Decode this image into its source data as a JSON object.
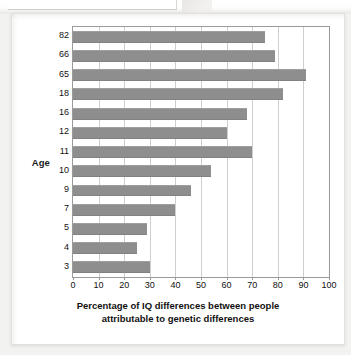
{
  "chart_data": {
    "type": "bar",
    "orientation": "horizontal",
    "title": "",
    "subtitle": "",
    "xlabel": "Percentage of IQ differences between people attributable to genetic differences",
    "xlabel_line1": "Percentage of IQ differences between people",
    "xlabel_line2": "attributable to genetic differences",
    "ylabel": "Age",
    "categories": [
      "82",
      "66",
      "65",
      "18",
      "16",
      "12",
      "11",
      "10",
      "9",
      "7",
      "5",
      "4",
      "3"
    ],
    "values": [
      75,
      79,
      91,
      82,
      68,
      60,
      70,
      54,
      46,
      40,
      29,
      25,
      30
    ],
    "xlim": [
      0,
      100
    ],
    "xticks": [
      0,
      10,
      20,
      30,
      40,
      50,
      60,
      70,
      80,
      90,
      100
    ],
    "xtick_labels": [
      "0",
      "10",
      "20",
      "30",
      "40",
      "50",
      "60",
      "70",
      "80",
      "90",
      "100"
    ],
    "grid": "vertical",
    "legend": "none",
    "bar_color": "#8e8e8e",
    "plot_background": "#ffffff",
    "gridline_color": "#cfcfcf",
    "axis_color": "#9a9a9a",
    "text_color": "#111111"
  }
}
